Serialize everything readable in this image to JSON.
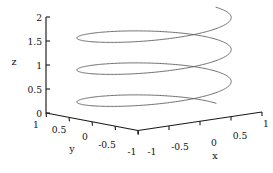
{
  "figure": {
    "background_color": "#ffffff",
    "width": 273,
    "height": 173
  },
  "chart_data": {
    "type": "line",
    "plot_kind": "3d-parametric-curve",
    "title": "",
    "subtitle": "",
    "xlabel": "x",
    "ylabel": "y",
    "zlabel": "z",
    "xlim": [
      -1,
      1
    ],
    "ylim": [
      -1,
      1
    ],
    "zlim": [
      0,
      2
    ],
    "xticks": [
      -1,
      -0.5,
      0,
      0.5,
      1
    ],
    "yticks": [
      1,
      0.5,
      0,
      -0.5,
      -1
    ],
    "zticks": [
      0,
      0.5,
      1,
      1.5,
      2
    ],
    "xticklabels": [
      "-1",
      "-0.5",
      "0",
      "0.5",
      "1"
    ],
    "yticklabels": [
      "1",
      "0.5",
      "0",
      "-0.5",
      "-1"
    ],
    "zticklabels": [
      "0",
      "0.5",
      "1",
      "1.5",
      "2"
    ],
    "grid": false,
    "box": false,
    "legend": null,
    "legend_position": "none",
    "annotations": [],
    "series": [
      {
        "name": "helix",
        "color": "#555555",
        "linewidth": 0.85,
        "turns": 3,
        "description": "x = cos(t), y = sin(t), z = t / (3*pi)",
        "t_range": [
          0,
          18.8496
        ],
        "x": [
          1.0,
          0.866,
          0.5,
          0.0,
          -0.5,
          -0.866,
          -1.0,
          -0.866,
          -0.5,
          0.0,
          0.5,
          0.866,
          1.0,
          0.866,
          0.5,
          0.0,
          -0.5,
          -0.866,
          -1.0,
          -0.866,
          -0.5,
          0.0,
          0.5,
          0.866,
          1.0,
          0.866,
          0.5,
          0.0,
          -0.5,
          -0.866,
          -1.0,
          -0.866,
          -0.5,
          0.0,
          0.5,
          0.866,
          1.0
        ],
        "y": [
          0.0,
          0.5,
          0.866,
          1.0,
          0.866,
          0.5,
          0.0,
          -0.5,
          -0.866,
          -1.0,
          -0.866,
          -0.5,
          0.0,
          0.5,
          0.866,
          1.0,
          0.866,
          0.5,
          0.0,
          -0.5,
          -0.866,
          -1.0,
          -0.866,
          -0.5,
          0.0,
          0.5,
          0.866,
          1.0,
          0.866,
          0.5,
          0.0,
          -0.5,
          -0.866,
          -1.0,
          -0.866,
          -0.5,
          0.0
        ],
        "z": [
          0.0,
          0.0556,
          0.1111,
          0.1667,
          0.2222,
          0.2778,
          0.3333,
          0.3889,
          0.4444,
          0.5,
          0.5556,
          0.6111,
          0.6667,
          0.7222,
          0.7778,
          0.8333,
          0.8889,
          0.9444,
          1.0,
          1.0556,
          1.1111,
          1.1667,
          1.2222,
          1.2778,
          1.3333,
          1.3889,
          1.4444,
          1.5,
          1.5556,
          1.6111,
          1.6667,
          1.7222,
          1.7778,
          1.8333,
          1.8889,
          1.9444,
          2.0
        ]
      }
    ]
  },
  "axes": {
    "z": {
      "label": "z",
      "ticks": [
        {
          "value": 2,
          "label": "2"
        },
        {
          "value": 1.5,
          "label": "1.5"
        },
        {
          "value": 1,
          "label": "1"
        },
        {
          "value": 0.5,
          "label": "0.5"
        },
        {
          "value": 0,
          "label": "0"
        }
      ]
    },
    "y": {
      "label": "y",
      "ticks": [
        {
          "value": 1,
          "label": "1"
        },
        {
          "value": 0.5,
          "label": "0.5"
        },
        {
          "value": 0,
          "label": "0"
        },
        {
          "value": -0.5,
          "label": "-0.5"
        },
        {
          "value": -1,
          "label": "-1"
        }
      ]
    },
    "x": {
      "label": "x",
      "ticks": [
        {
          "value": -1,
          "label": "-1"
        },
        {
          "value": -0.5,
          "label": "-0.5"
        },
        {
          "value": 0,
          "label": "0"
        },
        {
          "value": 0.5,
          "label": "0.5"
        },
        {
          "value": 1,
          "label": "1"
        }
      ]
    }
  },
  "style": {
    "axis_color": "#1a1a1a",
    "curve_color": "#555555",
    "text_color": "#111111"
  }
}
